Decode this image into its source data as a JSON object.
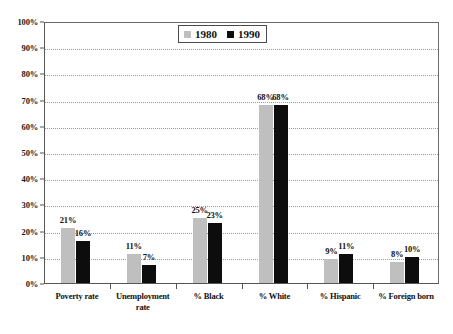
{
  "chart_data": {
    "type": "bar",
    "title": "",
    "subtitle": "",
    "xlabel": "",
    "ylabel": "",
    "ylim": [
      0,
      100
    ],
    "yticks": [
      "0%",
      "10%",
      "20%",
      "30%",
      "40%",
      "50%",
      "60%",
      "70%",
      "80%",
      "90%",
      "100%"
    ],
    "ytick_values": [
      0,
      10,
      20,
      30,
      40,
      50,
      60,
      70,
      80,
      90,
      100
    ],
    "grid": true,
    "legend_position": "top-center",
    "categories": [
      "Poverty rate",
      "Unemployment rate",
      "% Black",
      "% White",
      "% Hispanic",
      "% Foreign born"
    ],
    "category_lines": [
      [
        "Poverty rate"
      ],
      [
        "Unemployment",
        "rate"
      ],
      [
        "% Black"
      ],
      [
        "% White"
      ],
      [
        "% Hispanic"
      ],
      [
        "% Foreign born"
      ]
    ],
    "series": [
      {
        "name": "1980",
        "color": "#bfbfbf",
        "values": [
          21,
          11,
          25,
          68,
          9,
          8
        ],
        "labels": [
          "21%",
          "11%",
          "25%",
          "68%",
          "9%",
          "8%"
        ]
      },
      {
        "name": "1990",
        "color": "#0d0d0d",
        "values": [
          16,
          7,
          23,
          68,
          11,
          10
        ],
        "labels": [
          "16%",
          "7%",
          "23%",
          "68%",
          "11%",
          "10%"
        ]
      }
    ]
  },
  "legend": {
    "entries": [
      {
        "label": "1980",
        "color": "#bfbfbf"
      },
      {
        "label": "1990",
        "color": "#0d0d0d"
      }
    ]
  },
  "colors": {
    "series_1980": "#bfbfbf",
    "series_1990": "#0d0d0d",
    "gridline": "#9a9a9a",
    "axis": "#555555",
    "background": "#ffffff",
    "text": "#111111"
  }
}
